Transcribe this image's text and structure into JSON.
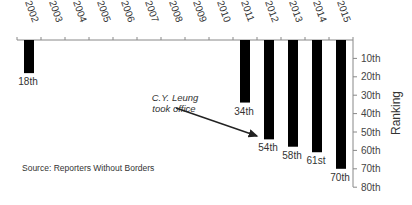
{
  "chart_data": {
    "type": "bar",
    "title": "",
    "xlabel": "",
    "ylabel": "Ranking",
    "orientation": "vertical, inverted (bars hang down from top axis)",
    "categories": [
      "2002",
      "2003",
      "2004",
      "2005",
      "2006",
      "2007",
      "2008",
      "2009",
      "2010",
      "2011",
      "2012",
      "2013",
      "2014",
      "2015"
    ],
    "values": [
      18,
      null,
      null,
      null,
      null,
      null,
      null,
      null,
      null,
      34,
      54,
      58,
      61,
      70
    ],
    "data_labels": [
      "18th",
      "",
      "",
      "",
      "",
      "",
      "",
      "",
      "",
      "34th",
      "54th",
      "58th",
      "61st",
      "70th"
    ],
    "y_ticks": [
      "10th",
      "20th",
      "30th",
      "40th",
      "50th",
      "60th",
      "70th",
      "80th"
    ],
    "y_tick_values": [
      10,
      20,
      30,
      40,
      50,
      60,
      70,
      80
    ],
    "ylim": [
      0,
      80
    ],
    "y_axis_position": "right",
    "x_axis_position": "top",
    "grid": false,
    "legend": null,
    "bar_color": "#000000",
    "annotation": {
      "text_line1": "C.Y. Leung",
      "text_line2": "took office",
      "points_to": "2012"
    },
    "source": "Source: Reporters Without Borders"
  }
}
